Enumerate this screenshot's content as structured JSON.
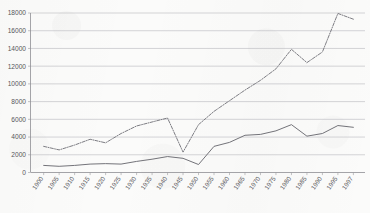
{
  "chart_data": {
    "type": "line",
    "title": "",
    "subtitle": "",
    "xlabel": "",
    "ylabel": "",
    "ylim": [
      0,
      18000
    ],
    "ytick_values": [
      0,
      2000,
      4000,
      6000,
      8000,
      10000,
      12000,
      14000,
      16000,
      18000
    ],
    "ytick_labels": [
      "0",
      "2000",
      "4000",
      "6000",
      "8000",
      "10000",
      "12000",
      "14000",
      "16000",
      "18000"
    ],
    "grid": true,
    "grid_axis": "y",
    "legend": "none",
    "legend_position": "none",
    "x": [
      "1900",
      "1905",
      "1910",
      "1915",
      "1920",
      "1925",
      "1930",
      "1935",
      "1940",
      "1945",
      "1950",
      "1955",
      "1960",
      "1965",
      "1970",
      "1975",
      "1980",
      "1985",
      "1990",
      "1995",
      "1997"
    ],
    "categories": [
      "1900",
      "1905",
      "1910",
      "1915",
      "1920",
      "1925",
      "1930",
      "1935",
      "1940",
      "1945",
      "1950",
      "1955",
      "1960",
      "1965",
      "1970",
      "1975",
      "1980",
      "1985",
      "1990",
      "1995",
      "1997"
    ],
    "series": [
      {
        "name": "upper-dashed-series",
        "style": "dash-dot",
        "color": "#76767c",
        "values": [
          2950,
          2550,
          3100,
          3750,
          3350,
          4400,
          5250,
          5700,
          6150,
          2300,
          5400,
          6900,
          8100,
          9300,
          10400,
          11700,
          13900,
          12400,
          13600,
          17950,
          17300
        ]
      },
      {
        "name": "lower-solid-series",
        "style": "solid",
        "color": "#6c6c72",
        "values": [
          800,
          700,
          800,
          950,
          1000,
          950,
          1250,
          1500,
          1800,
          1600,
          900,
          2950,
          3400,
          4200,
          4300,
          4700,
          5400,
          4100,
          4400,
          5300,
          5100
        ]
      }
    ]
  }
}
